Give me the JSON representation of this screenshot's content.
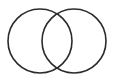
{
  "diagram": {
    "type": "venn",
    "stroke_color": "#2b2b2b",
    "background": "#ffffff",
    "circles": [
      {
        "name": "left-set",
        "cx": 40,
        "cy": 41,
        "r": 32
      },
      {
        "name": "right-set",
        "cx": 74,
        "cy": 41,
        "r": 32
      }
    ]
  }
}
